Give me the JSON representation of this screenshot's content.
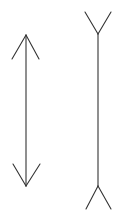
{
  "diagram": {
    "stroke_color": "#333333",
    "background": "#ffffff",
    "figures": [
      {
        "name": "inward-arrowheads",
        "shaft": {
          "x1": 26,
          "y1": 35,
          "x2": 26,
          "y2": 186
        },
        "top_fins": [
          {
            "x1": 26,
            "y1": 35,
            "x2": 12,
            "y2": 59
          },
          {
            "x1": 26,
            "y1": 35,
            "x2": 39,
            "y2": 59
          }
        ],
        "bottom_fins": [
          {
            "x1": 26,
            "y1": 186,
            "x2": 13,
            "y2": 164
          },
          {
            "x1": 26,
            "y1": 186,
            "x2": 40,
            "y2": 164
          }
        ]
      },
      {
        "name": "outward-fins",
        "shaft": {
          "x1": 98,
          "y1": 34,
          "x2": 98,
          "y2": 186
        },
        "top_fins": [
          {
            "x1": 98,
            "y1": 34,
            "x2": 85,
            "y2": 12
          },
          {
            "x1": 98,
            "y1": 34,
            "x2": 111,
            "y2": 12
          }
        ],
        "bottom_fins": [
          {
            "x1": 98,
            "y1": 186,
            "x2": 86,
            "y2": 209
          },
          {
            "x1": 98,
            "y1": 186,
            "x2": 111,
            "y2": 209
          }
        ]
      }
    ]
  }
}
